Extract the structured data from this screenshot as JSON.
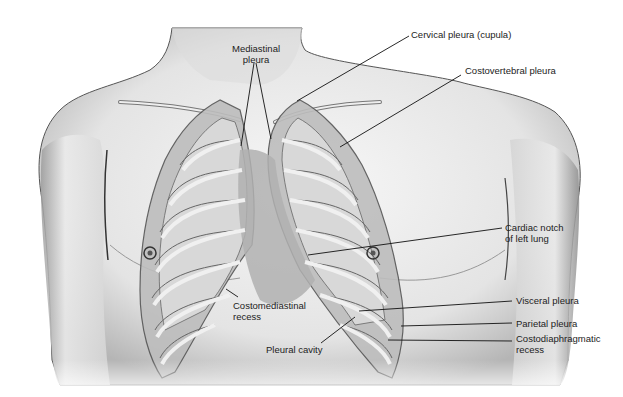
{
  "figure": {
    "colors": {
      "background": "#ffffff",
      "skin_light": "#f2f2f2",
      "skin_shadow": "#9a9a9a",
      "outline": "#3a3a3a",
      "pleura_fill": "#a8a8a8",
      "lung_tissue": "#d4d4d4",
      "rib": "#e6e6e6",
      "leader_line": "#111111",
      "label_text": "#222222"
    }
  },
  "labels": {
    "mediastinal_pleura": {
      "line1": "Mediastinal",
      "line2": "pleura"
    },
    "cervical_pleura": "Cervical pleura (cupula)",
    "costovertebral_pleura": "Costovertebral pleura",
    "cardiac_notch": {
      "line1": "Cardiac notch",
      "line2": "of left lung"
    },
    "visceral_pleura": "Visceral pleura",
    "parietal_pleura": "Parietal pleura",
    "costodiaphragmatic_recess": {
      "line1": "Costodiaphragmatic",
      "line2": "recess"
    },
    "costomediastinal_recess": {
      "line1": "Costomediastinal",
      "line2": "recess"
    },
    "pleural_cavity": "Pleural cavity"
  }
}
